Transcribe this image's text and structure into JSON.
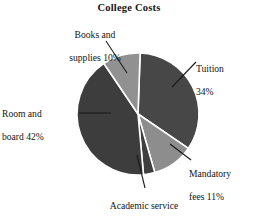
{
  "chart_data": {
    "type": "pie",
    "title": "College Costs",
    "xlabel": "",
    "ylabel": "",
    "legend": "none",
    "grid": false,
    "units": "percent",
    "categories": [
      "Tuition",
      "Mandatory fees",
      "Academic service fees",
      "Room and board",
      "Books and supplies"
    ],
    "values": [
      34,
      11,
      3,
      42,
      10
    ],
    "slices": [
      {
        "label": "Tuition",
        "value": 34,
        "value_text": "34%",
        "color": "#474747",
        "label_line1": "Tuition",
        "label_line2": "34%"
      },
      {
        "label": "Mandatory fees",
        "value": 11,
        "value_text": "11%",
        "color": "#8d8d8d",
        "label_line1": "Mandatory",
        "label_line2": "fees 11%"
      },
      {
        "label": "Academic service fees",
        "value": 3,
        "value_text": "3%",
        "color": "#3f3f3f",
        "label_line1": "Academic service",
        "label_line2": "fees 3%"
      },
      {
        "label": "Room and board",
        "value": 42,
        "value_text": "42%",
        "color": "#3d3d3d",
        "label_line1": "Room and",
        "label_line2": "board 42%"
      },
      {
        "label": "Books and supplies",
        "value": 10,
        "value_text": "10%",
        "color": "#919191",
        "label_line1": "Books and",
        "label_line2": "supplies 10%"
      }
    ],
    "total": 100,
    "colors": {
      "background": "#ffffff",
      "text": "#131313",
      "slice_border": "#ffffff",
      "leader_line": "#1a1a1a"
    }
  }
}
